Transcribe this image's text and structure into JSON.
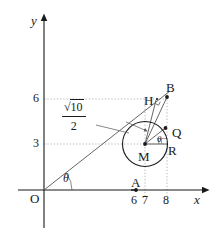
{
  "figure": {
    "kind": "coordinate-geometry-diagram",
    "background_color": "#ffffff",
    "ink_color": "#1a1a1a",
    "guide_color": "#9a9a9a",
    "axes": {
      "x_axis_label": "x",
      "y_axis_label": "y",
      "origin_label": "O"
    },
    "x_ticks": [
      {
        "label": "6",
        "value": 6
      },
      {
        "label": "7",
        "value": 7
      },
      {
        "label": "8",
        "value": 8
      }
    ],
    "y_ticks": [
      {
        "label": "3",
        "value": 3
      },
      {
        "label": "6",
        "value": 6
      }
    ],
    "points": [
      {
        "label": "A",
        "name": "point-a"
      },
      {
        "label": "B",
        "name": "point-b"
      },
      {
        "label": "H",
        "name": "point-h"
      },
      {
        "label": "M",
        "name": "point-m"
      },
      {
        "label": "Q",
        "name": "point-q"
      },
      {
        "label": "R",
        "name": "point-r"
      }
    ],
    "angles": [
      {
        "label": "θ",
        "name": "angle-theta-origin"
      },
      {
        "label": "θ",
        "name": "angle-theta-circle"
      }
    ],
    "radius_label": {
      "numerator_symbol": "√",
      "numerator_value": "10",
      "denominator": "2"
    }
  }
}
